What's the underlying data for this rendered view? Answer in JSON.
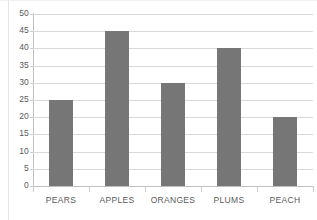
{
  "chart_data": {
    "type": "bar",
    "title": "",
    "subtitle": "",
    "xlabel": "",
    "ylabel": "",
    "categories": [
      "PEARS",
      "APPLES",
      "ORANGES",
      "PLUMS",
      "PEACH"
    ],
    "values": [
      25,
      45,
      30,
      40,
      20
    ],
    "series": [
      {
        "name": "",
        "values": [
          25,
          45,
          30,
          40,
          20
        ]
      }
    ],
    "ylim": [
      0,
      50
    ],
    "ytick_labels": [
      "0",
      "5",
      "10",
      "15",
      "20",
      "25",
      "30",
      "35",
      "40",
      "45",
      "50"
    ],
    "ytick_values": [
      0,
      5,
      10,
      15,
      20,
      25,
      30,
      35,
      40,
      45,
      50
    ],
    "ytick_step": 5,
    "grid": true,
    "grid_axis": "y",
    "legend": false,
    "legend_position": "none",
    "annotations": [],
    "data_labels": false
  },
  "style": {
    "bar_color": "#767676",
    "gridline_color": "#d9d9d9",
    "axis_line_color": "#bfbfbf",
    "tick_mark_color": "#cccccc",
    "text_color": "#595959",
    "background_color": "#ffffff"
  }
}
